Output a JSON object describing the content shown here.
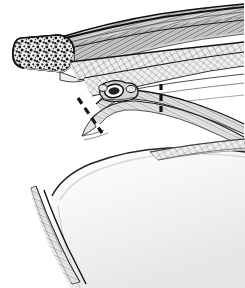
{
  "figure": {
    "title": "Anatomical cross-section illustration",
    "style": "grayscale pen-and-ink medical illustration",
    "background_color": "#ffffff",
    "ink_color": "#1a1a1a",
    "width": 245,
    "height": 288,
    "structures": [
      {
        "id": "bone-cross-section",
        "name": "Cancellous bone cut end",
        "description": "Rounded capsule-shaped cut end of bone showing stippled trabecular spongy texture",
        "fill": "#f2f2f2",
        "stipple_color": "#222222",
        "cx": 47,
        "cy": 52,
        "rx": 27,
        "ry": 17,
        "rotation": -16
      },
      {
        "id": "muscle-belly",
        "name": "Muscle belly with longitudinal striations",
        "description": "Tapering striated band sweeping from the bone end to the upper right corner",
        "fill": "#d8d8d8",
        "stroke": "#161616"
      },
      {
        "id": "fascial-band-upper",
        "name": "Superficial fascial band",
        "description": "Cross-hatched fibrous sheet running to the right margin",
        "fill": "#e8e8e8",
        "stroke": "#1f1f1f"
      },
      {
        "id": "fascial-band-lower",
        "name": "Deep fascial band",
        "description": "Second cross-hatched fibrous sheet below the superficial band",
        "fill": "#ececec",
        "stroke": "#1f1f1f"
      },
      {
        "id": "neurovascular-bundle",
        "name": "Neurovascular bundle in cross-section",
        "description": "Oval ring structure with dark lumen sitting on the arching tissue band",
        "fill": "#cfcfcf",
        "lumen_fill": "#2a2a2a",
        "cx": 113,
        "cy": 93,
        "rx": 11,
        "ry": 8
      },
      {
        "id": "arching-tissue-band",
        "name": "Arching periosteal / tendon band",
        "description": "Curved layered band arching from left to right beneath the bundle",
        "fill": "#e0e0e0",
        "stroke": "#1c1c1c"
      },
      {
        "id": "pale-flap",
        "name": "Retracted soft tissue flap",
        "description": "Large pale gradient dome occupying the lower half of the figure",
        "fill_light": "#fdfdfd",
        "fill_shadow": "#e4e4e4",
        "stroke": "#2b2b2b"
      },
      {
        "id": "flap-edge-fibers",
        "name": "Fibrous edge of the flap",
        "description": "Thin hatched strip along the left and upper rim of the pale flap",
        "stroke": "#4a4a4a"
      }
    ],
    "markers": [
      {
        "id": "cut-line-oblique",
        "name": "Oblique dashed cut line",
        "orientation": "oblique",
        "x1": 78,
        "y1": 98,
        "x2": 102,
        "y2": 133,
        "dash": "7 5",
        "width": 3.2,
        "color": "#111111"
      },
      {
        "id": "cut-line-vertical",
        "name": "Vertical dashed cut line",
        "orientation": "vertical",
        "x1": 161,
        "y1": 84,
        "x2": 161,
        "y2": 117,
        "dash": "6 5",
        "width": 3.2,
        "color": "#111111"
      }
    ],
    "labels": []
  }
}
